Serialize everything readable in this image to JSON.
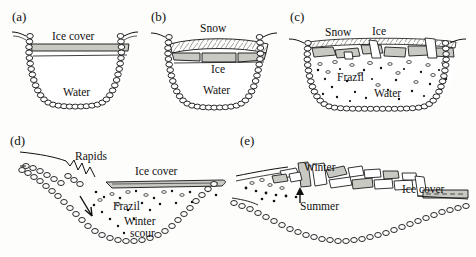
{
  "figure": {
    "background_color": "#fdfdfc",
    "ink_color": "#111111",
    "ice_fill_color": "#c9c9c4",
    "snow_fill_color": "#ffffff",
    "style": "hand-drawn scientific line illustration, scanned"
  },
  "panels": [
    {
      "tag": "(a)",
      "view": "channel cross-section",
      "caption_labels": [
        {
          "text": "Ice cover",
          "x": 52,
          "y": 31
        },
        {
          "text": "Water",
          "x": 63,
          "y": 87
        }
      ]
    },
    {
      "tag": "(b)",
      "view": "channel cross-section",
      "caption_labels": [
        {
          "text": "Snow",
          "x": 200,
          "y": 28
        },
        {
          "text": "Ice",
          "x": 211,
          "y": 65
        },
        {
          "text": "Water",
          "x": 203,
          "y": 89
        }
      ]
    },
    {
      "tag": "(c)",
      "view": "channel cross-section",
      "caption_labels": [
        {
          "text": "Snow",
          "x": 325,
          "y": 32
        },
        {
          "text": "Ice",
          "x": 372,
          "y": 31
        },
        {
          "text": "Frazil",
          "x": 337,
          "y": 77
        },
        {
          "text": "Water",
          "x": 374,
          "y": 92
        }
      ]
    },
    {
      "tag": "(d)",
      "view": "longitudinal profile",
      "caption_labels": [
        {
          "text": "Rapids",
          "x": 75,
          "y": 157
        },
        {
          "text": "Ice cover",
          "x": 135,
          "y": 170
        },
        {
          "text": "Frazil",
          "x": 113,
          "y": 206
        },
        {
          "text": "Winter",
          "x": 124,
          "y": 222
        },
        {
          "text": "scour",
          "x": 130,
          "y": 233
        }
      ]
    },
    {
      "tag": "(e)",
      "view": "longitudinal profile",
      "caption_labels": [
        {
          "text": "Winter",
          "x": 304,
          "y": 169
        },
        {
          "text": "Summer",
          "x": 300,
          "y": 207
        },
        {
          "text": "Ice cover",
          "x": 402,
          "y": 190
        }
      ]
    }
  ],
  "panel_tags": {
    "a": "(a)",
    "b": "(b)",
    "c": "(c)",
    "d": "(d)",
    "e": "(e)"
  },
  "labels": {
    "ice_cover": "Ice cover",
    "water": "Water",
    "snow": "Snow",
    "ice": "Ice",
    "frazil": "Frazil",
    "rapids": "Rapids",
    "winter": "Winter",
    "scour": "scour",
    "summer": "Summer"
  }
}
